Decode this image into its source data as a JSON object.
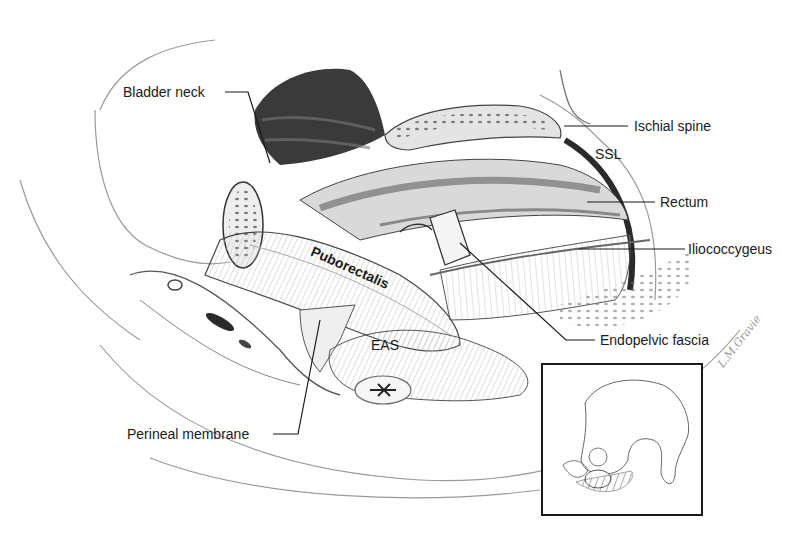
{
  "figure": {
    "labels": {
      "bladder_neck": "Bladder neck",
      "ischial_spine": "Ischial spine",
      "ssl": "SSL",
      "rectum": "Rectum",
      "iliococcygeus": "Iliococcygeus",
      "puborectalis": "Puborectalis",
      "endopelvic_fascia": "Endopelvic fascia",
      "eas": "EAS",
      "perineal_membrane": "Perineal membrane"
    },
    "signature": "L.M.Gravie",
    "inset": {
      "description": "Orientation sketch of pelvis"
    },
    "colors": {
      "ink": "#1a1a1a",
      "shade_dark": "#3a3a3a",
      "shade_mid": "#8c8c8c",
      "shade_light": "#d6d6d6",
      "background": "#ffffff"
    }
  }
}
